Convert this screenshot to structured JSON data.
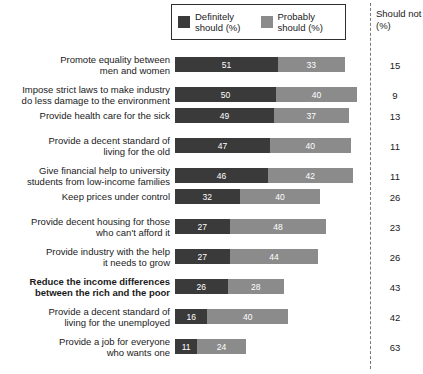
{
  "legend": {
    "entries": [
      {
        "label": "Definitely\nshould (%)",
        "key": "definitely",
        "color": "#3a3a3a"
      },
      {
        "label": "Probably\nshould (%)",
        "key": "probably",
        "color": "#8b8b8b"
      }
    ]
  },
  "should_not_header": "Should\nnot (%)",
  "chart_data": {
    "type": "bar",
    "subtype": "stacked-horizontal",
    "title": "",
    "xlabel": "",
    "ylabel": "",
    "xlim": [
      0,
      100
    ],
    "grid": false,
    "legend_position": "top-center",
    "categories": [
      "Promote equality between\nmen and women",
      "Impose strict laws to make industry\ndo less damage to the environment",
      "Provide health care for the sick",
      "Provide a decent standard of\nliving for the old",
      "Give financial help to university\nstudents from low-income families",
      "Keep prices under control",
      "Provide decent housing for those\nwho can't afford it",
      "Provide industry with the help\nit needs to grow",
      "Reduce the income differences\nbetween the rich and the poor",
      "Provide a decent standard of\nliving for the unemployed",
      "Provide a job for everyone\nwho wants one"
    ],
    "series": [
      {
        "name": "Definitely should (%)",
        "key": "definitely",
        "color": "#3a3a3a",
        "values": [
          51,
          50,
          49,
          47,
          46,
          32,
          27,
          27,
          26,
          16,
          11
        ]
      },
      {
        "name": "Probably should (%)",
        "key": "probably",
        "color": "#8b8b8b",
        "values": [
          33,
          40,
          37,
          40,
          42,
          40,
          48,
          44,
          28,
          40,
          24
        ]
      },
      {
        "name": "Should not (%)",
        "key": "should_not",
        "color": "#1a1a1a",
        "values": [
          15,
          9,
          13,
          11,
          11,
          26,
          23,
          26,
          43,
          42,
          63
        ]
      }
    ],
    "highlight_index": 8
  }
}
